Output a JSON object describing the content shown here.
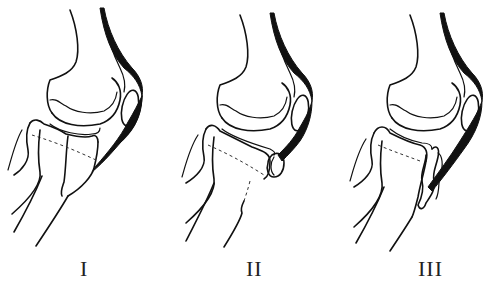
{
  "figure": {
    "panels": [
      {
        "label": "I",
        "x_offset": 0
      },
      {
        "label": "II",
        "x_offset": 165
      },
      {
        "label": "III",
        "x_offset": 340
      }
    ],
    "colors": {
      "line": "#111111",
      "background": "#ffffff"
    }
  }
}
